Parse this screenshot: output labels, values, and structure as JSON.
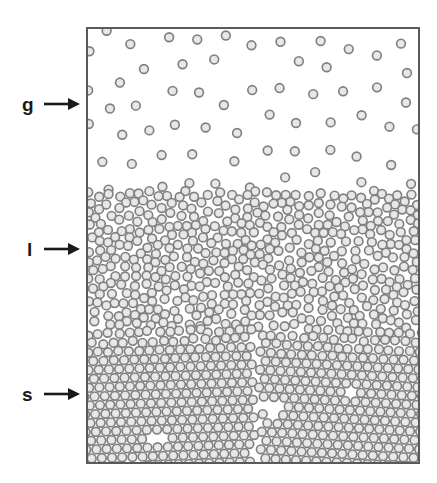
{
  "figure": {
    "background_color": "#ffffff",
    "box": {
      "x": 86,
      "y": 27,
      "width": 334,
      "height": 437,
      "border_color": "#5a5a5a",
      "border_width": 2,
      "fill_color": "#ffffff"
    }
  },
  "labels": [
    {
      "id": "gas",
      "text": "g",
      "meaning": "gas phase",
      "label_x": 22,
      "label_y": 95,
      "arrow_x1": 44,
      "arrow_y1": 104,
      "arrow_x2": 80,
      "arrow_y2": 104,
      "arrow_icon": "right-arrow-icon"
    },
    {
      "id": "liquid",
      "text": "l",
      "meaning": "liquid phase",
      "label_x": 26,
      "label_y": 240,
      "arrow_x1": 44,
      "arrow_y1": 249,
      "arrow_x2": 80,
      "arrow_y2": 249,
      "arrow_icon": "right-arrow-icon"
    },
    {
      "id": "solid",
      "text": "s",
      "meaning": "solid phase",
      "label_x": 22,
      "label_y": 385,
      "arrow_x1": 44,
      "arrow_y1": 394,
      "arrow_x2": 80,
      "arrow_y2": 394,
      "arrow_icon": "right-arrow-icon"
    }
  ],
  "chart_data": {
    "type": "scatter",
    "xlabel": "",
    "ylabel": "",
    "xlim": [
      0,
      334
    ],
    "ylim": [
      0,
      437
    ],
    "grid": false,
    "legend_position": "left-outside",
    "legend_entries": [
      "g",
      "l",
      "s"
    ],
    "particle": {
      "radius_px": 4.4,
      "ring_color": "#808080",
      "ring_width": 1.6,
      "fill_color": "#b3b3b3",
      "core_color": "#dcdcdc"
    },
    "regions": [
      {
        "name": "gas",
        "label": "g",
        "y_top": 0,
        "y_bottom": 161,
        "packing": "random-dilute",
        "particle_count": 62,
        "number_density_rel": 0.04,
        "description": "Sparse randomly distributed particles"
      },
      {
        "name": "liquid",
        "label": "l",
        "y_top": 161,
        "y_bottom": 300,
        "packing": "random-dense",
        "particle_count": 980,
        "number_density_rel": 0.72,
        "description": "Disordered dense packing with voids"
      },
      {
        "name": "solid",
        "label": "s",
        "y_top": 300,
        "y_bottom": 437,
        "packing": "hexagonal-close-packed",
        "particle_count": 1180,
        "number_density_rel": 0.91,
        "lattice_spacing_px": 10.2,
        "grain_boundary_x": 168,
        "vacancy_count": 5,
        "description": "Crystalline triangular lattice with two grains separated by a vertical grain boundary"
      }
    ]
  }
}
